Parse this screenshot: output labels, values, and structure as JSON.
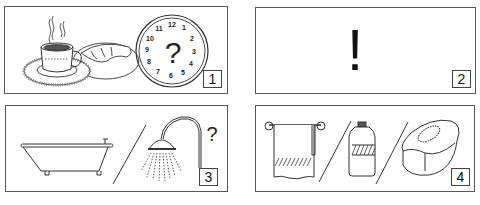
{
  "panels": [
    {
      "number": "1",
      "description": "Coffee cup on saucer with croissant on plate, clock with question mark",
      "clock_numbers": [
        "12",
        "1",
        "2",
        "3",
        "4",
        "5",
        "6",
        "7",
        "8",
        "9",
        "10",
        "11"
      ],
      "clock_center_text": "?"
    },
    {
      "number": "2",
      "description": "Exclamation mark",
      "symbol": "!"
    },
    {
      "number": "3",
      "description": "Bathtub / shower head, question mark",
      "question": "?"
    },
    {
      "number": "4",
      "description": "Towel on rail / bottle / soap"
    }
  ],
  "colors": {
    "line": "#333333",
    "border": "#555555",
    "background": "#ffffff"
  }
}
